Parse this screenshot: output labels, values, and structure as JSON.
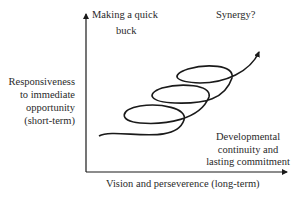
{
  "diagram": {
    "y_axis_label": [
      "Responsiveness",
      "to immediate",
      "opportunity",
      "(short-term)"
    ],
    "x_axis_label": "Vision and perseverence (long-term)",
    "top_left_label": [
      "Making a quick",
      "buck"
    ],
    "top_right_label": "Synergy?",
    "bottom_right_label": [
      "Developmental",
      "continuity and",
      "lasting commitment"
    ],
    "curve": "upward spiral with three loops ending in arrow",
    "colors": {
      "line": "#1a1a1a",
      "text": "#2a2a2a",
      "background": "#ffffff"
    }
  }
}
